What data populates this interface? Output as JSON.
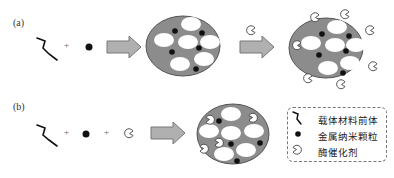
{
  "panels": [
    {
      "label": "(a)",
      "plus_signs": [
        "+"
      ]
    },
    {
      "label": "(b)",
      "plus_signs": [
        "+",
        "+"
      ]
    }
  ],
  "legend": {
    "items": [
      {
        "icon": "precursor-curve-icon",
        "label": "载体材料前体"
      },
      {
        "icon": "metal-nanoparticle-dot-icon",
        "label": "金属纳米颗粒"
      },
      {
        "icon": "enzyme-pacman-icon",
        "label": "酶催化剂"
      }
    ]
  },
  "colors": {
    "support": "#8c8c8c",
    "pore": "#ffffff",
    "arrow_fill": "#b0b0b0",
    "arrow_stroke": "#777777",
    "particle": "#111111"
  }
}
